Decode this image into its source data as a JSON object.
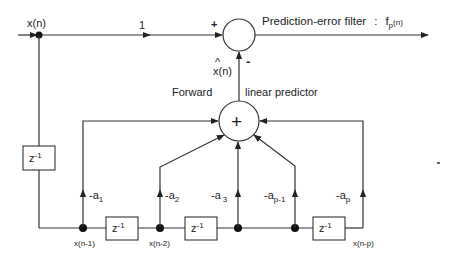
{
  "diagram": {
    "title": "Prediction-error filter",
    "output_label": "f",
    "output_sub": "p",
    "output_arg": "(n)",
    "title_sep": ":",
    "input_label": "x(n)",
    "gain_label": "1",
    "plus_sign": "+",
    "minus_sign": "-",
    "estimate_hat": "^",
    "estimate_label": "x(n)",
    "predictor_left": "Forward",
    "predictor_right": "linear predictor",
    "adder_symbol": "+",
    "delay_label": "z",
    "delay_exp": "-1",
    "taps": [
      {
        "coef": "-a",
        "sub": "1"
      },
      {
        "coef": "-a",
        "sub": "2"
      },
      {
        "coef": "-a",
        "sub": "3"
      },
      {
        "coef": "-a",
        "sub": "p-1"
      },
      {
        "coef": "-a",
        "sub": "p"
      }
    ],
    "node_labels": [
      "x(n-1)",
      "x(n-2)",
      "x(n-p)"
    ]
  },
  "colors": {
    "line": "#333333",
    "background": "#ffffff",
    "text": "#222222"
  }
}
